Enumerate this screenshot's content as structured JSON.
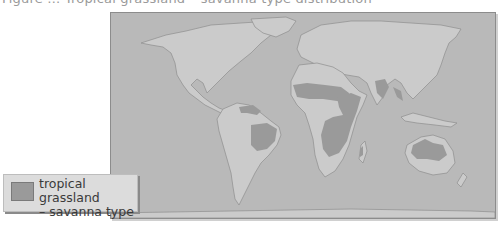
{
  "figure": {
    "caption_fragment": "Figure … Tropical grassland – savanna type distribution",
    "colors": {
      "ocean": "#b9b9b9",
      "land": "#cbcbcb",
      "coastline": "#8e8e8e",
      "savanna": "#9a9a9a",
      "frame_border": "#8c8c8c",
      "legend_bg": "#dcdcdc"
    }
  },
  "map": {
    "projection": "world map",
    "regions_shaded": [
      "South America – northern Venezuela/Colombia (llanos)",
      "South America – Brazilian cerrado",
      "Africa – Sahel/Sudan belt",
      "Africa – East and southern-central Africa",
      "Africa – Madagascar (west)",
      "Asia – India (Deccan)",
      "Asia – Southeast Asia (Indochina)",
      "Australia – northern and eastern interior"
    ]
  },
  "legend": {
    "items": [
      {
        "label_line1": "tropical grassland",
        "label_line2": "– savanna type",
        "color": "#9a9a9a"
      }
    ]
  }
}
